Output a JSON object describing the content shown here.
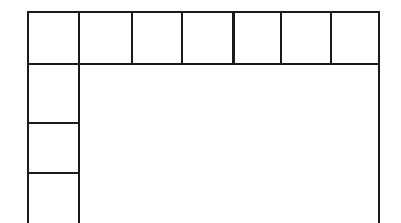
{
  "document": {
    "kind": "blank-table-form",
    "description": "Empty ruled table skeleton from a scanned form",
    "background_color": "#ffffff",
    "line_color": "#1a1a1a",
    "page_width": 401,
    "page_height": 223,
    "bottom_edge_cropped": true
  },
  "table": {
    "outer_bounds": {
      "left": 27,
      "top": 11,
      "right": 380,
      "bottom": 223
    },
    "header_row": {
      "top": 11,
      "bottom": 64,
      "cell_count": 7,
      "x_dividers": [
        79,
        132,
        182,
        233,
        281,
        331
      ],
      "cells": [
        {
          "index": 0,
          "label": "",
          "left": 27,
          "right": 79
        },
        {
          "index": 1,
          "label": "",
          "left": 79,
          "right": 132
        },
        {
          "index": 2,
          "label": "",
          "left": 132,
          "right": 182
        },
        {
          "index": 3,
          "label": "",
          "left": 182,
          "right": 233
        },
        {
          "index": 4,
          "label": "",
          "left": 233,
          "right": 281
        },
        {
          "index": 5,
          "label": "",
          "left": 281,
          "right": 331
        },
        {
          "index": 6,
          "label": "",
          "left": 331,
          "right": 380
        }
      ]
    },
    "left_column": {
      "left": 27,
      "right": 79,
      "row_count": 3,
      "y_dividers": [
        123,
        173
      ],
      "cells": [
        {
          "index": 0,
          "label": "",
          "top": 64,
          "bottom": 123
        },
        {
          "index": 1,
          "label": "",
          "top": 123,
          "bottom": 173
        },
        {
          "index": 2,
          "label": "",
          "top": 173,
          "bottom": 223
        }
      ]
    },
    "body_area": {
      "label": "",
      "left": 79,
      "top": 64,
      "right": 380,
      "bottom": 223,
      "empty": true
    }
  }
}
